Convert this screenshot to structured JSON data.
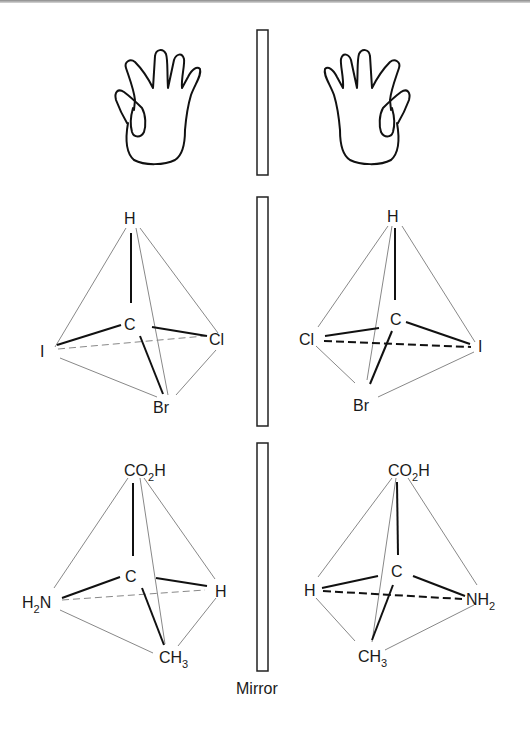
{
  "figure": {
    "mirror_label": "Mirror",
    "rows": [
      {
        "name": "hands",
        "left": {
          "object": "left-hand"
        },
        "right": {
          "object": "right-hand"
        }
      },
      {
        "name": "bromochloroiodomethane",
        "left": {
          "top": "H",
          "center": "C",
          "left": "I",
          "right": "Cl",
          "bottom": "Br"
        },
        "right": {
          "top": "H",
          "center": "C",
          "left": "Cl",
          "right": "I",
          "bottom": "Br"
        }
      },
      {
        "name": "alanine",
        "left": {
          "top": "CO",
          "top_sub": "2",
          "top_tail": "H",
          "center": "C",
          "left": "H",
          "left_sub": "2",
          "left_tail": "N",
          "right": "H",
          "bottom": "CH",
          "bottom_sub": "3"
        },
        "right": {
          "top": "CO",
          "top_sub": "2",
          "top_tail": "H",
          "center": "C",
          "left": "H",
          "right": "NH",
          "right_sub": "2",
          "bottom": "CH",
          "bottom_sub": "3"
        }
      }
    ]
  }
}
